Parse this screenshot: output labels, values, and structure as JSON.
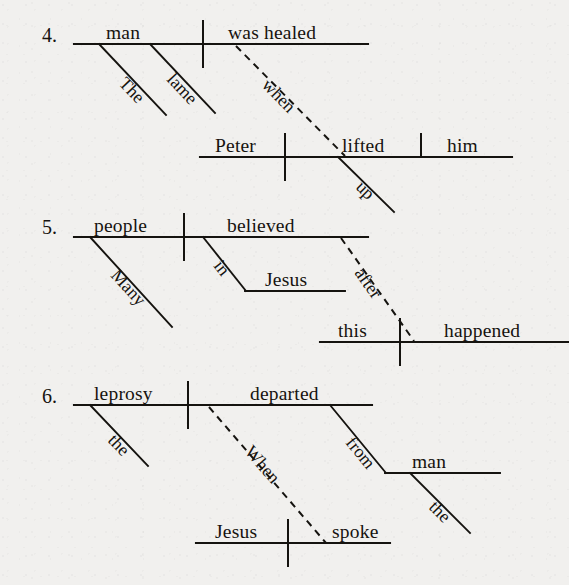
{
  "page": {
    "kind": "grammar-sentence-diagrams",
    "background_color": "#f1f0ee",
    "ink_color": "#16130f",
    "width": 569,
    "height": 585
  },
  "exercises": [
    {
      "number": "4.",
      "sentence": "The lame man was healed when Peter lifted him up.",
      "main_clause": {
        "subject": "man",
        "predicate": "was healed",
        "modifiers": [
          {
            "word": "The",
            "attaches_to": "man"
          },
          {
            "word": "lame",
            "attaches_to": "man"
          }
        ]
      },
      "connector": {
        "word": "when",
        "style": "dashed"
      },
      "subordinate_clause": {
        "subject": "Peter",
        "predicate": "lifted",
        "direct_object": "him",
        "modifiers": [
          {
            "word": "up",
            "attaches_to": "lifted"
          }
        ]
      }
    },
    {
      "number": "5.",
      "sentence": "Many people believed in Jesus after this happened.",
      "main_clause": {
        "subject": "people",
        "predicate": "believed",
        "modifiers": [
          {
            "word": "Many",
            "attaches_to": "people"
          }
        ],
        "prepositional_phrase": {
          "preposition": "in",
          "object": "Jesus"
        }
      },
      "connector": {
        "word": "after",
        "style": "dashed"
      },
      "subordinate_clause": {
        "subject": "this",
        "predicate": "happened"
      }
    },
    {
      "number": "6.",
      "sentence": "The leprosy departed from the man when Jesus spoke.",
      "main_clause": {
        "subject": "leprosy",
        "predicate": "departed",
        "modifiers": [
          {
            "word": "the",
            "attaches_to": "leprosy"
          }
        ],
        "prepositional_phrase": {
          "preposition": "from",
          "object": "man",
          "object_modifier": "the"
        }
      },
      "connector": {
        "word": "When",
        "style": "dashed"
      },
      "subordinate_clause": {
        "subject": "Jesus",
        "predicate": "spoke"
      }
    }
  ],
  "labels": {
    "ex4": {
      "number": "4.",
      "subject": "man",
      "predicate": "was healed",
      "mod_the": "The",
      "mod_lame": "lame",
      "connector": "when",
      "sub_subject": "Peter",
      "sub_predicate": "lifted",
      "sub_object": "him",
      "mod_up": "up"
    },
    "ex5": {
      "number": "5.",
      "subject": "people",
      "predicate": "believed",
      "mod_many": "Many",
      "prep": "in",
      "prep_object": "Jesus",
      "connector": "after",
      "sub_subject": "this",
      "sub_predicate": "happened"
    },
    "ex6": {
      "number": "6.",
      "subject": "leprosy",
      "predicate": "departed",
      "mod_the": "the",
      "prep": "from",
      "prep_object": "man",
      "prep_object_mod": "the",
      "connector": "When",
      "sub_subject": "Jesus",
      "sub_predicate": "spoke"
    }
  }
}
